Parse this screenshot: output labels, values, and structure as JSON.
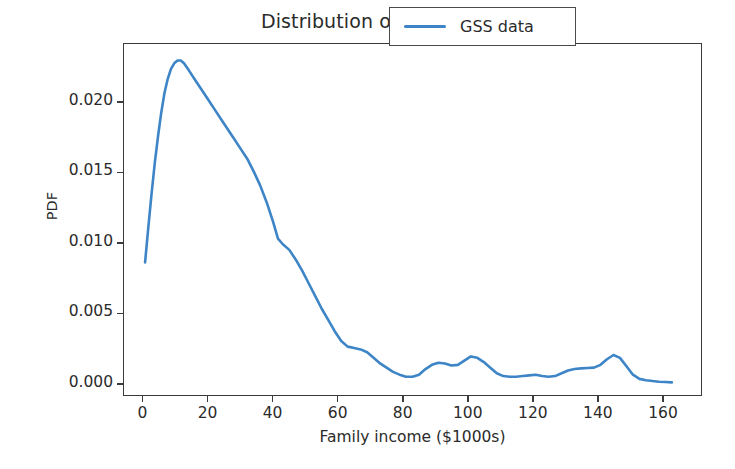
{
  "chart_data": {
    "type": "line",
    "title": "Distribution of income",
    "xlabel": "Family income ($1000s)",
    "ylabel": "PDF",
    "xlim": [
      -6,
      172
    ],
    "ylim": [
      -0.00085,
      0.02418
    ],
    "grid": false,
    "legend_position": "upper right",
    "legend_entries": [
      "GSS data"
    ],
    "line_color": "#3d85c6",
    "line_width": 2.6,
    "xticks": [
      0,
      20,
      40,
      60,
      80,
      100,
      120,
      140,
      160
    ],
    "xticklabels": [
      "0",
      "20",
      "40",
      "60",
      "80",
      "100",
      "120",
      "140",
      "160"
    ],
    "yticks": [
      0.0,
      0.005,
      0.01,
      0.015,
      0.02
    ],
    "yticklabels": [
      "0.000",
      "0.005",
      "0.010",
      "0.015",
      "0.020"
    ],
    "series": [
      {
        "name": "GSS data",
        "x": [
          0.5,
          1.5,
          2.5,
          3.5,
          4.5,
          5.5,
          6.5,
          7.5,
          8.5,
          9.5,
          10.5,
          11.5,
          12.5,
          14,
          16,
          18,
          20,
          22,
          24,
          26,
          28,
          30,
          32,
          34,
          36,
          38,
          40,
          41.5,
          43,
          45,
          47,
          49,
          51,
          53,
          55,
          57,
          59,
          61,
          63,
          65,
          67,
          69,
          71,
          73,
          75,
          77,
          79,
          81,
          83,
          85,
          87,
          89,
          91,
          93,
          95,
          97,
          99,
          101,
          103,
          105,
          107,
          109,
          111,
          113,
          115,
          117,
          119,
          121,
          123,
          125,
          127,
          129,
          131,
          133,
          135,
          137,
          139,
          141,
          143,
          145,
          147,
          149,
          151,
          153,
          155,
          157,
          159,
          161,
          163
        ],
        "y": [
          0.0086,
          0.0111,
          0.0135,
          0.0157,
          0.0176,
          0.0193,
          0.0207,
          0.0217,
          0.0224,
          0.0228,
          0.023,
          0.023,
          0.0228,
          0.0223,
          0.0216,
          0.0209,
          0.0202,
          0.0195,
          0.0188,
          0.0181,
          0.0174,
          0.0167,
          0.016,
          0.0151,
          0.0141,
          0.0129,
          0.0115,
          0.0103,
          0.0099,
          0.0095,
          0.0088,
          0.008,
          0.0071,
          0.0062,
          0.0053,
          0.0045,
          0.0037,
          0.003,
          0.0026,
          0.0025,
          0.0024,
          0.0022,
          0.0018,
          0.0014,
          0.0011,
          0.0008,
          0.0006,
          0.00045,
          0.00045,
          0.0006,
          0.001,
          0.0013,
          0.00145,
          0.0014,
          0.00125,
          0.0013,
          0.0016,
          0.0019,
          0.0018,
          0.0015,
          0.0011,
          0.0007,
          0.0005,
          0.00045,
          0.00045,
          0.0005,
          0.00055,
          0.0006,
          0.0005,
          0.00045,
          0.0005,
          0.0007,
          0.0009,
          0.001,
          0.00105,
          0.00108,
          0.0011,
          0.0013,
          0.0017,
          0.002,
          0.0018,
          0.0012,
          0.0006,
          0.0003,
          0.0002,
          0.00015,
          0.0001,
          8e-05,
          5e-05
        ]
      }
    ]
  },
  "legend": {
    "label": "GSS data"
  },
  "axes": {
    "title": "Distribution of income",
    "xlabel": "Family income ($1000s)",
    "ylabel": "PDF"
  }
}
